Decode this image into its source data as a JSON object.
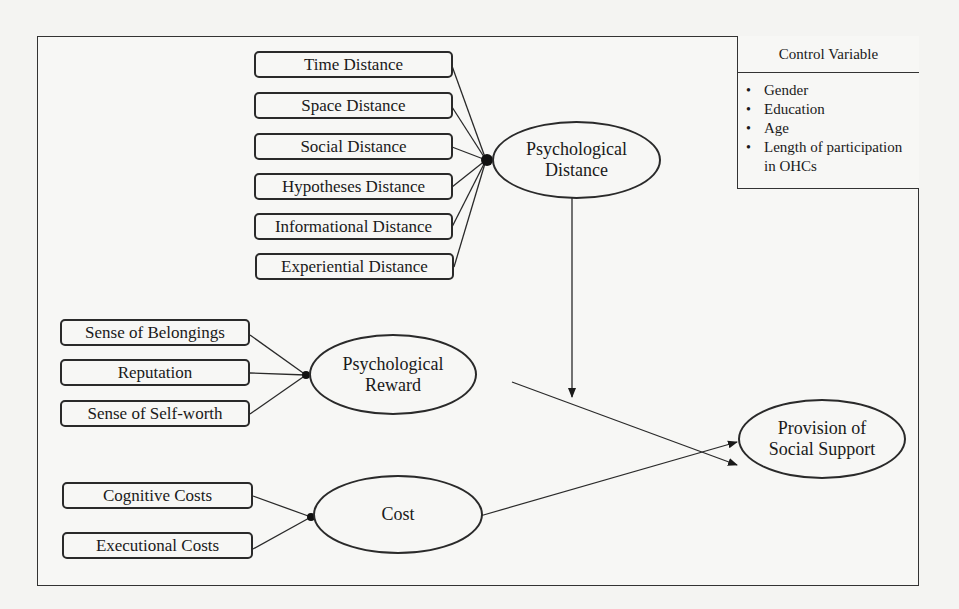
{
  "diagram": {
    "type": "research-model",
    "psychological_distance": {
      "label_line1": "Psychological",
      "label_line2": "Distance",
      "indicators": [
        "Time Distance",
        "Space Distance",
        "Social Distance",
        "Hypotheses Distance",
        "Informational Distance",
        "Experiential Distance"
      ]
    },
    "psychological_reward": {
      "label_line1": "Psychological",
      "label_line2": "Reward",
      "indicators": [
        "Sense of Belongings",
        "Reputation",
        "Sense of Self-worth"
      ]
    },
    "cost": {
      "label": "Cost",
      "indicators": [
        "Cognitive Costs",
        "Executional Costs"
      ]
    },
    "outcome": {
      "label_line1": "Provision of",
      "label_line2": "Social Support"
    },
    "control_variable": {
      "title": "Control Variable",
      "items": [
        "Gender",
        "Education",
        "Age",
        "Length of participation in OHCs"
      ],
      "item4_line1": "Length of participation",
      "item4_line2": "in OHCs"
    },
    "relationships": [
      {
        "from": "Psychological Reward",
        "to": "Provision of Social Support",
        "type": "direct"
      },
      {
        "from": "Cost",
        "to": "Provision of Social Support",
        "type": "direct"
      },
      {
        "from": "Psychological Distance",
        "to": "Psychological Reward -> Provision of Social Support",
        "type": "moderation"
      }
    ],
    "colors": {
      "stroke": "#2a2a2a",
      "background": "#f4f4f2"
    }
  }
}
